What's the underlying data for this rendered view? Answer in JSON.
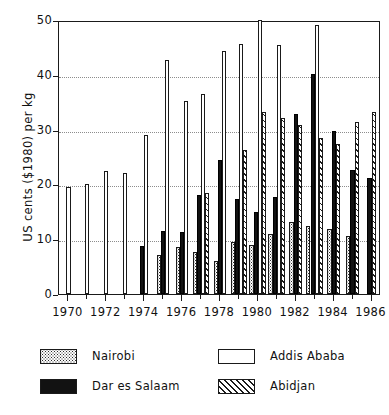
{
  "chart_data": {
    "type": "bar",
    "title": "",
    "subtitle": "",
    "xlabel": "",
    "ylabel": "US cents ($1980) per kg",
    "ylim": [
      0,
      50
    ],
    "yticks": [
      0,
      10,
      20,
      30,
      40,
      50
    ],
    "grid": true,
    "grid_axis": "y",
    "legend_position": "below-plot",
    "x": [
      1970,
      1971,
      1972,
      1973,
      1974,
      1975,
      1976,
      1977,
      1978,
      1979,
      1980,
      1981,
      1982,
      1983,
      1984,
      1985,
      1986
    ],
    "xtick_labels": [
      "1970",
      "1972",
      "1974",
      "1976",
      "1978",
      "1980",
      "1982",
      "1984",
      "1986"
    ],
    "xticks": [
      1970,
      1972,
      1974,
      1976,
      1978,
      1980,
      1982,
      1984,
      1986
    ],
    "series": [
      {
        "name": "Nairobi",
        "fill": "dotted",
        "color": "#fdfdfd",
        "values": [
          null,
          null,
          null,
          null,
          null,
          7.2,
          8.5,
          7.7,
          6.0,
          9.5,
          9.0,
          11.0,
          13.2,
          12.5,
          11.8,
          10.6,
          null
        ]
      },
      {
        "name": "Dar es Salaam",
        "fill": "solid",
        "color": "#121212",
        "values": [
          null,
          null,
          null,
          null,
          8.8,
          11.5,
          11.4,
          18.1,
          24.5,
          17.3,
          15.0,
          17.7,
          32.8,
          40.2,
          29.8,
          22.6,
          21.2
        ]
      },
      {
        "name": "Addis Ababa",
        "fill": "empty",
        "color": "#ffffff",
        "values": [
          19.5,
          20.0,
          22.5,
          22.0,
          29.0,
          42.7,
          35.2,
          36.5,
          44.4,
          45.6,
          50.0,
          45.5,
          null,
          49.0,
          null,
          null,
          null
        ]
      },
      {
        "name": "Abidjan",
        "fill": "hatched",
        "color": "#ffffff",
        "values": [
          null,
          null,
          null,
          null,
          null,
          null,
          null,
          18.5,
          null,
          26.3,
          33.2,
          32.2,
          30.8,
          28.5,
          27.4,
          31.3,
          33.3
        ]
      }
    ]
  },
  "legend": {
    "entries": [
      {
        "label": "Nairobi",
        "style": "nairobi"
      },
      {
        "label": "Addis Ababa",
        "style": "addis"
      },
      {
        "label": "Dar es Salaam",
        "style": "dar"
      },
      {
        "label": "Abidjan",
        "style": "abidjan"
      }
    ]
  }
}
